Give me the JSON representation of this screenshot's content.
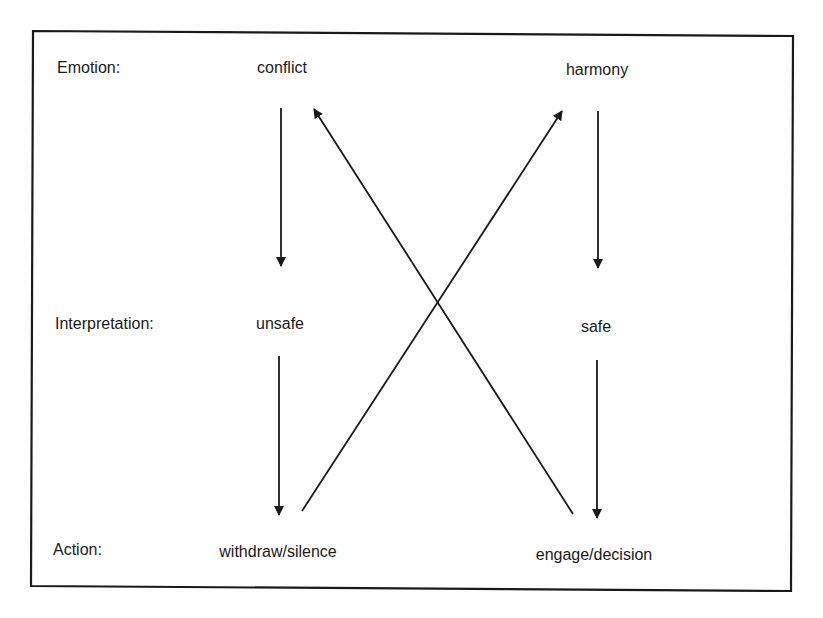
{
  "diagram": {
    "row_labels": {
      "emotion": "Emotion:",
      "interpretation": "Interpretation:",
      "action": "Action:"
    },
    "nodes": {
      "conflict": "conflict",
      "harmony": "harmony",
      "unsafe": "unsafe",
      "safe": "safe",
      "withdraw": "withdraw/silence",
      "engage": "engage/decision"
    },
    "edges": [
      {
        "from": "conflict",
        "to": "unsafe",
        "style": "arrow"
      },
      {
        "from": "unsafe",
        "to": "withdraw/silence",
        "style": "arrow"
      },
      {
        "from": "harmony",
        "to": "safe",
        "style": "arrow"
      },
      {
        "from": "safe",
        "to": "engage/decision",
        "style": "arrow"
      },
      {
        "from": "withdraw/silence",
        "to": "harmony",
        "style": "arrow"
      },
      {
        "from": "engage/decision",
        "to": "conflict",
        "style": "arrow"
      }
    ],
    "colors": {
      "stroke": "#1a1a1a",
      "background": "#ffffff"
    }
  }
}
